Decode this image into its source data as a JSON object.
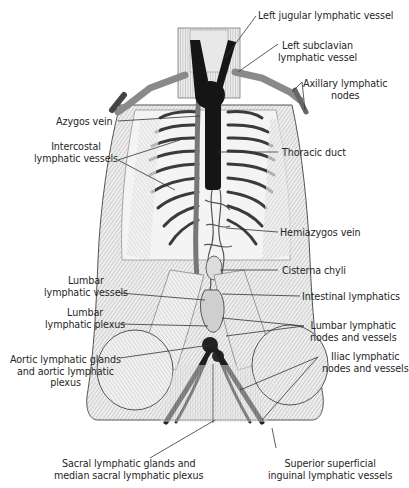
{
  "figure": {
    "colors": {
      "background": "#ffffff",
      "ink": "#262626",
      "thoracic_duct": "#151515",
      "tissue": "#d9d9d9",
      "leader_line": "#333333"
    }
  },
  "labels": {
    "left_jugular": {
      "lines": [
        "Left jugular lymphatic vessel"
      ]
    },
    "left_subclavian": {
      "lines": [
        "Left subclavian",
        "lymphatic vessel"
      ]
    },
    "axillary": {
      "lines": [
        "Axillary lymphatic",
        "nodes"
      ]
    },
    "azygos": {
      "lines": [
        "Azygos vein"
      ]
    },
    "intercostal": {
      "lines": [
        "Intercostal",
        "lymphatic vessels"
      ]
    },
    "thoracic_duct": {
      "lines": [
        "Thoracic duct"
      ]
    },
    "hemiazygos": {
      "lines": [
        "Hemiazygos vein"
      ]
    },
    "cisterna": {
      "lines": [
        "Cisterna chyli"
      ]
    },
    "lumbar_vessels": {
      "lines": [
        "Lumbar",
        "lymphatic vessels"
      ]
    },
    "intestinal": {
      "lines": [
        "Intestinal lymphatics"
      ]
    },
    "lumbar_plexus": {
      "lines": [
        "Lumbar",
        "lymphatic plexus"
      ]
    },
    "lumbar_nodes": {
      "lines": [
        "Lumbar lymphatic",
        "nodes and vessels"
      ]
    },
    "aortic": {
      "lines": [
        "Aortic lymphatic glands",
        "and aortic lymphatic",
        "plexus"
      ]
    },
    "iliac": {
      "lines": [
        "Iliac lymphatic",
        "nodes and vessels"
      ]
    },
    "sacral": {
      "lines": [
        "Sacral lymphatic glands and",
        "median sacral lymphatic plexus"
      ]
    },
    "inguinal": {
      "lines": [
        "Superior superficial",
        "inguinal lymphatic vessels"
      ]
    }
  }
}
